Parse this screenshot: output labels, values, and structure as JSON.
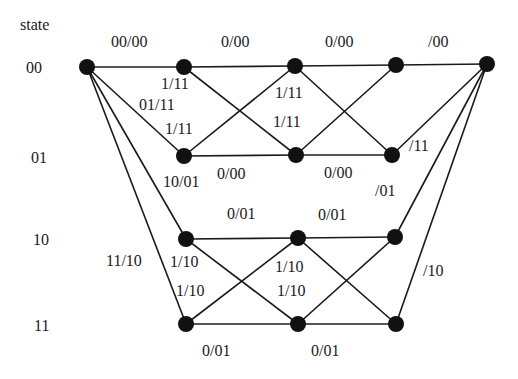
{
  "diagram": {
    "type": "trellis",
    "axis_label": "state",
    "states": [
      "00",
      "01",
      "10",
      "11"
    ],
    "nodes": {
      "start": [
        87,
        67
      ],
      "c1": [
        [
          184,
          67
        ],
        [
          184,
          156
        ],
        [
          186,
          239
        ],
        [
          186,
          324
        ]
      ],
      "c2": [
        [
          295,
          66
        ],
        [
          296,
          155
        ],
        [
          298,
          238
        ],
        [
          298,
          324
        ]
      ],
      "c3": [
        [
          396,
          65
        ],
        [
          392,
          155
        ],
        [
          395,
          237
        ],
        [
          396,
          324
        ]
      ],
      "end": [
        487,
        64
      ]
    },
    "edge_labels": [
      {
        "text": "00/00",
        "x": 111,
        "y": 34
      },
      {
        "text": "0/00",
        "x": 221,
        "y": 34
      },
      {
        "text": "0/00",
        "x": 325,
        "y": 34
      },
      {
        "text": "/00",
        "x": 428,
        "y": 34
      },
      {
        "text": "1/11",
        "x": 161,
        "y": 76
      },
      {
        "text": "01/11",
        "x": 139,
        "y": 97
      },
      {
        "text": "1/11",
        "x": 165,
        "y": 121
      },
      {
        "text": "1/11",
        "x": 275,
        "y": 85
      },
      {
        "text": "1/11",
        "x": 273,
        "y": 114
      },
      {
        "text": "/11",
        "x": 409,
        "y": 138
      },
      {
        "text": "10/01",
        "x": 163,
        "y": 174
      },
      {
        "text": "0/00",
        "x": 217,
        "y": 166
      },
      {
        "text": "0/00",
        "x": 324,
        "y": 165
      },
      {
        "text": "/01",
        "x": 375,
        "y": 183
      },
      {
        "text": "0/01",
        "x": 227,
        "y": 206
      },
      {
        "text": "0/01",
        "x": 318,
        "y": 207
      },
      {
        "text": "11/10",
        "x": 106,
        "y": 253
      },
      {
        "text": "1/10",
        "x": 170,
        "y": 254
      },
      {
        "text": "1/10",
        "x": 176,
        "y": 283
      },
      {
        "text": "1/10",
        "x": 275,
        "y": 259
      },
      {
        "text": "1/10",
        "x": 277,
        "y": 283
      },
      {
        "text": "/10",
        "x": 423,
        "y": 263
      },
      {
        "text": "0/01",
        "x": 202,
        "y": 343
      },
      {
        "text": "0/01",
        "x": 311,
        "y": 343
      }
    ],
    "state_labels": [
      {
        "text": "state",
        "x": 20,
        "y": 17
      },
      {
        "text": "00",
        "x": 26,
        "y": 60
      },
      {
        "text": "01",
        "x": 31,
        "y": 150
      },
      {
        "text": "10",
        "x": 33,
        "y": 232
      },
      {
        "text": "11",
        "x": 34,
        "y": 318
      }
    ]
  }
}
